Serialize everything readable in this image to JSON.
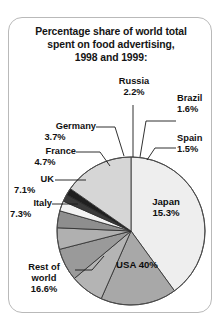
{
  "card": {
    "title_lines": [
      "Percentage share of world total",
      "spent on food advertising,",
      "1998 and 1999:"
    ]
  },
  "chart_data": {
    "type": "pie",
    "title": "Percentage share of world total spent on food advertising, 1998 and 1999:",
    "unit": "%",
    "total": 100.0,
    "start_angle_deg": -90,
    "direction": "clockwise",
    "categories": [
      "USA",
      "Rest of world",
      "Japan",
      "Italy",
      "UK",
      "France",
      "Germany",
      "Russia",
      "Brazil",
      "Spain"
    ],
    "values": [
      40.0,
      16.6,
      15.3,
      7.3,
      7.1,
      4.7,
      3.7,
      2.2,
      1.6,
      1.5
    ],
    "slices": [
      {
        "name": "USA",
        "value": 40.0,
        "label": "USA 40%",
        "color": "#eeeeee",
        "label_position": "inside"
      },
      {
        "name": "Rest of world",
        "value": 16.6,
        "label": "Rest of\nworld\n16.6%",
        "color": "#a8a8a8",
        "label_position": "outside-left"
      },
      {
        "name": "Italy",
        "value": 7.3,
        "label": "Italy\n7.3%",
        "color": "#b4b4b4",
        "label_position": "outside-left"
      },
      {
        "name": "UK",
        "value": 7.1,
        "label": "UK\n7.1%",
        "color": "#9a9a9a",
        "label_position": "outside-left"
      },
      {
        "name": "France",
        "value": 4.7,
        "label": "France\n4.7%",
        "color": "#b0b0b0",
        "label_position": "outside-left"
      },
      {
        "name": "Germany",
        "value": 3.7,
        "label": "Germany\n3.7%",
        "color": "#8e8e8e",
        "label_position": "outside-top"
      },
      {
        "name": "Russia",
        "value": 2.2,
        "label": "Russia\n2.2%",
        "color": "#f2f2f2",
        "label_position": "outside-top"
      },
      {
        "name": "Brazil",
        "value": 1.6,
        "label": "Brazil\n1.6%",
        "color": "#3a3a3a",
        "label_position": "outside-right"
      },
      {
        "name": "Spain",
        "value": 1.5,
        "label": "Spain\n1.5%",
        "color": "#1f1f1f",
        "label_position": "outside-right"
      },
      {
        "name": "Japan",
        "value": 15.3,
        "label": "Japan\n15.3%",
        "color": "#d6d6d6",
        "label_position": "inside"
      }
    ],
    "legend": "none",
    "grid": false
  },
  "labels": {
    "germany_name": "Germany",
    "germany_value": "3.7%",
    "russia_name": "Russia",
    "russia_value": "2.2%",
    "brazil_name": "Brazil",
    "brazil_value": "1.6%",
    "spain_name": "Spain",
    "spain_value": "1.5%",
    "france_name": "France",
    "france_value": "4.7%",
    "uk_name": "UK",
    "uk_value": "7.1%",
    "italy_name": "Italy",
    "italy_value": "7.3%",
    "restofworld_line1": "Rest of",
    "restofworld_line2": "world",
    "restofworld_value": "16.6%",
    "japan_name": "Japan",
    "japan_value": "15.3%",
    "usa_label": "USA 40%"
  }
}
